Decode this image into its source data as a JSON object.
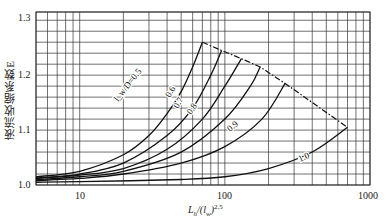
{
  "chart_data": {
    "type": "line",
    "title": "",
    "xlabel": "L_h/(l_w)^2.5",
    "ylabel": "液流收缩系数E",
    "x_scale": "log",
    "xlim": [
      5,
      1000
    ],
    "ylim": [
      1.0,
      1.315
    ],
    "x_ticks": [
      "10",
      "100",
      "1000"
    ],
    "y_ticks": [
      "1.0",
      "1.1",
      "1.2",
      "1.3"
    ],
    "grid": true,
    "legend": "inline curve labels",
    "series": [
      {
        "name": "l_w/D=0.5",
        "label": "l_w/D=0.5",
        "x": [
          5,
          10,
          20,
          30,
          40,
          50,
          60,
          70
        ],
        "y": [
          1.015,
          1.025,
          1.055,
          1.09,
          1.13,
          1.17,
          1.215,
          1.26
        ]
      },
      {
        "name": "0.6",
        "label": "0.6",
        "x": [
          5,
          10,
          20,
          40,
          60,
          80,
          95
        ],
        "y": [
          1.013,
          1.02,
          1.04,
          1.09,
          1.14,
          1.2,
          1.245
        ]
      },
      {
        "name": "0.7",
        "label": "0.7",
        "x": [
          5,
          10,
          20,
          40,
          70,
          100,
          130
        ],
        "y": [
          1.012,
          1.018,
          1.03,
          1.065,
          1.12,
          1.18,
          1.23
        ]
      },
      {
        "name": "0.8",
        "label": "0.8",
        "x": [
          5,
          10,
          20,
          50,
          100,
          150,
          175
        ],
        "y": [
          1.01,
          1.015,
          1.025,
          1.06,
          1.12,
          1.18,
          1.215
        ]
      },
      {
        "name": "0.9",
        "label": "0.9",
        "x": [
          5,
          10,
          20,
          50,
          100,
          180,
          260
        ],
        "y": [
          1.008,
          1.012,
          1.02,
          1.04,
          1.07,
          1.12,
          1.185
        ]
      },
      {
        "name": "1.0",
        "label": "1.0",
        "x": [
          5,
          10,
          50,
          100,
          200,
          400,
          700
        ],
        "y": [
          1.005,
          1.006,
          1.01,
          1.015,
          1.03,
          1.06,
          1.105
        ]
      },
      {
        "name": "envelope",
        "style": "dash-dot",
        "x": [
          70,
          95,
          130,
          175,
          260,
          700
        ],
        "y": [
          1.26,
          1.245,
          1.23,
          1.215,
          1.185,
          1.105
        ]
      }
    ]
  }
}
